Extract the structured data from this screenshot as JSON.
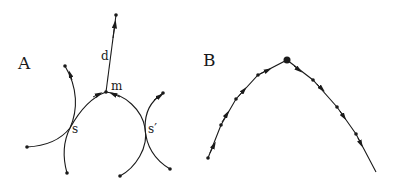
{
  "panels": [
    {
      "label": "A",
      "annotations": {
        "d": "d",
        "m": "m",
        "s": "s",
        "s_prime": "s′"
      }
    },
    {
      "label": "B"
    }
  ],
  "colors": {
    "stroke": "#1a1a1a",
    "background": "#ffffff"
  }
}
